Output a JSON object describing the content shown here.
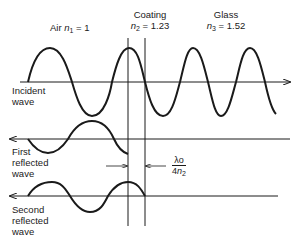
{
  "media": {
    "air": {
      "name": "Air",
      "index_symbol": "n",
      "index_sub": "1",
      "index_value": "1"
    },
    "coating": {
      "name": "Coating",
      "index_symbol": "n",
      "index_sub": "2",
      "index_value": "1.23"
    },
    "glass": {
      "name": "Glass",
      "index_symbol": "n",
      "index_sub": "3",
      "index_value": "1.52"
    }
  },
  "waves": {
    "incident": {
      "label_line1": "Incident",
      "label_line2": "wave"
    },
    "first_reflected": {
      "label_line1": "First",
      "label_line2": "reflected",
      "label_line3": "wave"
    },
    "second_reflected": {
      "label_line1": "Second",
      "label_line2": "reflected",
      "label_line3": "wave"
    }
  },
  "dimension": {
    "numerator": "λo",
    "denominator_prefix": "4",
    "denominator_symbol": "n",
    "denominator_sub": "2"
  },
  "equals": "=",
  "colors": {
    "stroke": "#1a1a1a",
    "background": "#ffffff"
  }
}
